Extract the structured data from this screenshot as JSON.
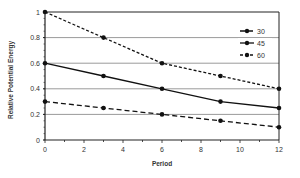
{
  "chart_data": {
    "type": "line",
    "title": "",
    "xlabel": "Period",
    "ylabel": "Relative Potential Energy",
    "xlim": [
      0,
      12
    ],
    "ylim": [
      0,
      1
    ],
    "x_ticks": [
      0,
      2,
      4,
      6,
      8,
      10,
      12
    ],
    "y_ticks": [
      0,
      0.2,
      0.4,
      0.6,
      0.8,
      1
    ],
    "y_tick_labels": [
      "0",
      "0.2",
      "0.4",
      "0.6",
      "0.8",
      "1"
    ],
    "grid": "horizontal",
    "legend_position": "upper right, inside",
    "series": [
      {
        "name": "30",
        "style": "long-dash",
        "x": [
          0,
          3,
          6,
          9,
          12
        ],
        "values": [
          0.3,
          0.25,
          0.2,
          0.15,
          0.1
        ]
      },
      {
        "name": "45",
        "style": "solid",
        "x": [
          0,
          3,
          6,
          9,
          12
        ],
        "values": [
          0.6,
          0.5,
          0.4,
          0.3,
          0.25
        ]
      },
      {
        "name": "60",
        "style": "short-dash",
        "x": [
          0,
          3,
          6,
          9,
          12
        ],
        "values": [
          1.0,
          0.8,
          0.6,
          0.5,
          0.4
        ]
      }
    ]
  },
  "colors": {
    "line": "#111111",
    "grid": "#9a9a9a",
    "axis": "#222222"
  }
}
